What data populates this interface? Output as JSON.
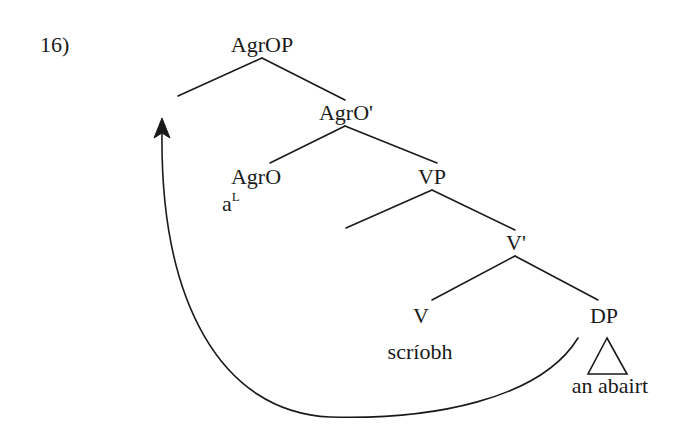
{
  "example": {
    "number": "16)"
  },
  "tree": {
    "nodes": {
      "agrop": "AgrOP",
      "agro_bar": "AgrO'",
      "agro": "AgrO",
      "agro_content": "a",
      "agro_content_sup": "L",
      "vp": "VP",
      "v_bar": "V'",
      "v": "V",
      "v_content": "scríobh",
      "dp": "DP",
      "dp_content": "an abairt"
    },
    "movement": {
      "from": "DP",
      "to": "Spec AgrOP",
      "arrow": "curved-arrow"
    }
  },
  "colors": {
    "line": "#1a1a1a",
    "background": "#ffffff"
  }
}
